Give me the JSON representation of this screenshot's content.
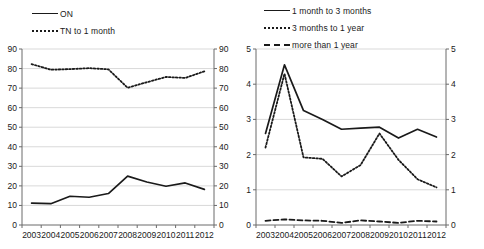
{
  "chart_data": [
    {
      "id": "left",
      "type": "line",
      "title": "",
      "xlabel": "",
      "ylabel": "",
      "x": [
        "2003",
        "2004",
        "2005",
        "2006",
        "2007",
        "2008",
        "2009",
        "2010",
        "2011",
        "2012"
      ],
      "categories": [
        "2003",
        "2004",
        "2005",
        "2006",
        "2007",
        "2008",
        "2009",
        "2010",
        "2011",
        "2012"
      ],
      "ylim": [
        0,
        90
      ],
      "yticks": [
        0,
        10,
        20,
        30,
        40,
        50,
        60,
        70,
        80,
        90
      ],
      "ytick_labels": [
        "0",
        "10",
        "20",
        "30",
        "40",
        "50",
        "60",
        "70",
        "80",
        "90"
      ],
      "right_axis": true,
      "right_ylim": [
        0,
        90
      ],
      "right_yticks": [
        0,
        10,
        20,
        30,
        40,
        50,
        60,
        70,
        80,
        90
      ],
      "grid": true,
      "legend_position": "top-left",
      "series": [
        {
          "name": "ON",
          "style": "solid",
          "values": [
            11.2,
            10.9,
            14.7,
            14.2,
            16.1,
            25.0,
            22.0,
            19.8,
            21.5,
            18.2
          ]
        },
        {
          "name": "TN to 1 month",
          "style": "dotted",
          "values": [
            82.3,
            79.4,
            79.7,
            80.2,
            79.6,
            70.2,
            73.0,
            75.7,
            75.2,
            78.6
          ]
        }
      ]
    },
    {
      "id": "right",
      "type": "line",
      "title": "",
      "xlabel": "",
      "ylabel": "",
      "x": [
        "2003",
        "2004",
        "2005",
        "2006",
        "2007",
        "2008",
        "2009",
        "2010",
        "2011",
        "2012"
      ],
      "categories": [
        "2003",
        "2004",
        "2005",
        "2006",
        "2007",
        "2008",
        "2009",
        "2010",
        "2011",
        "2012"
      ],
      "ylim": [
        0,
        5
      ],
      "yticks": [
        0,
        1,
        2,
        3,
        4,
        5
      ],
      "ytick_labels": [
        "0",
        "1",
        "2",
        "3",
        "4",
        "5"
      ],
      "right_axis": true,
      "right_ylim": [
        0,
        5
      ],
      "right_yticks": [
        0,
        1,
        2,
        3,
        4,
        5
      ],
      "grid": true,
      "legend_position": "top-left",
      "series": [
        {
          "name": "1 month to 3 months",
          "style": "solid",
          "values": [
            2.6,
            4.55,
            3.25,
            3.0,
            2.72,
            2.75,
            2.78,
            2.47,
            2.72,
            2.5
          ]
        },
        {
          "name": "3 months to 1 year",
          "style": "dotted",
          "values": [
            2.2,
            4.3,
            1.92,
            1.88,
            1.38,
            1.7,
            2.6,
            1.85,
            1.3,
            1.07
          ]
        },
        {
          "name": "more than 1 year",
          "style": "dashed",
          "values": [
            0.12,
            0.16,
            0.13,
            0.12,
            0.06,
            0.13,
            0.1,
            0.06,
            0.12,
            0.1
          ]
        }
      ]
    }
  ],
  "left_chart": {
    "legend": [
      {
        "label": "ON",
        "style": "solid"
      },
      {
        "label": "TN to 1 month",
        "style": "dotted"
      }
    ]
  },
  "right_chart": {
    "legend": [
      {
        "label": "1 month to 3 months",
        "style": "solid"
      },
      {
        "label": "3 months to 1 year",
        "style": "dotted"
      },
      {
        "label": "more than 1 year",
        "style": "dashed"
      }
    ]
  },
  "colors": {
    "line": "#1a1a1a",
    "grid": "#c9c9c9",
    "axis": "#6b6b6b",
    "background": "#ffffff"
  }
}
